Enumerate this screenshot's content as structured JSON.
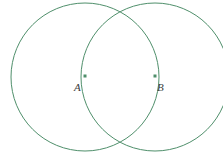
{
  "figure": {
    "kind": "geometric-construction",
    "width": 223,
    "height": 159,
    "background_color": "#ffffff",
    "stroke_color": "#4f8f6b",
    "stroke_width": 1,
    "label_color": "#3c3c3c",
    "point_marker_color": "#4f8f6b",
    "point_marker_size": 3
  },
  "circles": [
    {
      "id": "circle-a",
      "name": "circle-centered-at-A",
      "cx": 85,
      "cy": 77,
      "r": 74,
      "fill": "none"
    },
    {
      "id": "circle-b",
      "name": "circle-centered-at-B",
      "cx": 155,
      "cy": 77,
      "r": 74,
      "fill": "none"
    }
  ],
  "points": [
    {
      "id": "point-a",
      "label": "A",
      "cx": 85,
      "cy": 76,
      "label_x": 74,
      "label_y": 82
    },
    {
      "id": "point-b",
      "label": "B",
      "cx": 155,
      "cy": 76,
      "label_x": 157,
      "label_y": 82
    }
  ],
  "intersections": [
    {
      "id": "intersection-top",
      "x": 120,
      "y": 8
    },
    {
      "id": "intersection-bottom",
      "x": 120,
      "y": 146
    }
  ]
}
